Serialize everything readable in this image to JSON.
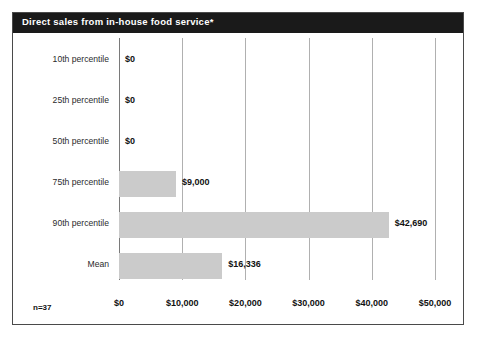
{
  "chart": {
    "title": "Direct sales from in-house food service*",
    "sample_size_label": "n=37",
    "colors": {
      "title_bar": "#1a1a1a",
      "title_text": "#ffffff",
      "bar_fill": "#cbcbcb",
      "gridline": "#b0b0b0",
      "frame_border": "#4a4a4a",
      "background": "#ffffff"
    }
  },
  "chart_data": {
    "type": "bar",
    "orientation": "horizontal",
    "title": "Direct sales from in-house food service*",
    "xlabel": "",
    "ylabel": "",
    "categories": [
      "10th percentile",
      "25th percentile",
      "50th percentile",
      "75th percentile",
      "90th percentile",
      "Mean"
    ],
    "values": [
      0,
      0,
      0,
      9000,
      42690,
      16336
    ],
    "value_labels": [
      "$0",
      "$0",
      "$0",
      "$9,000",
      "$42,690",
      "$16,336"
    ],
    "xlim": [
      0,
      50000
    ],
    "xticks": [
      0,
      10000,
      20000,
      30000,
      40000,
      50000
    ],
    "xtick_labels": [
      "$0",
      "$10,000",
      "$20,000",
      "$30,000",
      "$40,000",
      "$50,000"
    ],
    "grid": true,
    "legend": false,
    "annotations": [
      "n=37"
    ]
  }
}
